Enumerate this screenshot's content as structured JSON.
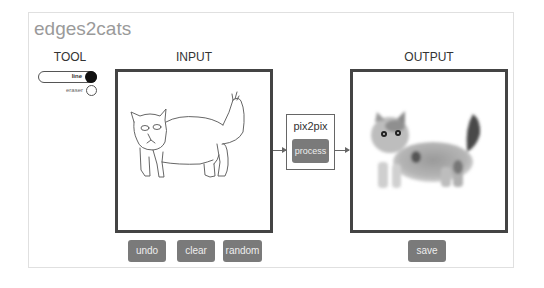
{
  "app": {
    "title": "edges2cats"
  },
  "tool": {
    "label": "TOOL",
    "options": [
      {
        "label": "line",
        "selected": true
      },
      {
        "label": "eraser",
        "selected": false
      }
    ]
  },
  "input": {
    "label": "INPUT",
    "content": "hand-drawn cat sketch",
    "buttons": {
      "undo": "undo",
      "clear": "clear",
      "random": "random"
    }
  },
  "model": {
    "label": "pix2pix",
    "process_label": "process"
  },
  "output": {
    "label": "OUTPUT",
    "content": "generated cat image",
    "buttons": {
      "save": "save"
    }
  },
  "colors": {
    "button_bg": "#7a7a7a",
    "button_text": "#eeeeee",
    "title": "#9a9a9a",
    "box_border": "#444444"
  }
}
